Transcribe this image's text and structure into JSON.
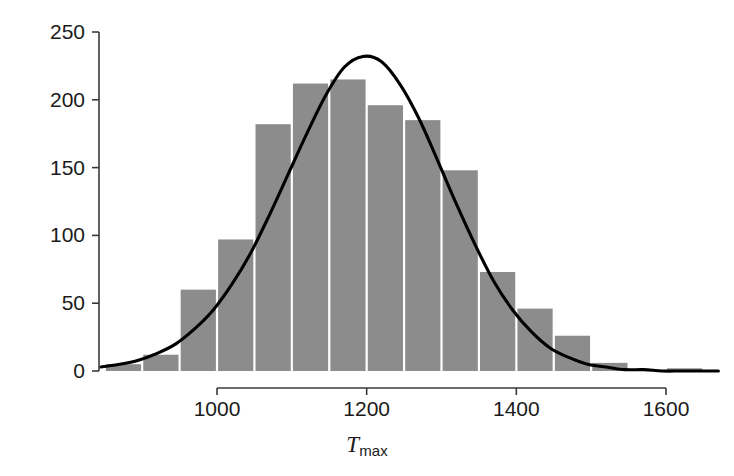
{
  "chart_data": {
    "type": "bar",
    "title": "",
    "subtitle": "",
    "xlabel": "T_max",
    "xlabel_base": "T",
    "xlabel_sub": "max",
    "ylabel": "",
    "xlim": [
      845,
      1672
    ],
    "ylim": [
      0,
      250
    ],
    "grid": false,
    "legend": null,
    "x_ticks": [
      1000,
      1200,
      1400,
      1600
    ],
    "x_tick_labels": [
      "1000",
      "1200",
      "1400",
      "1600"
    ],
    "y_ticks": [
      0,
      50,
      100,
      150,
      200,
      250
    ],
    "y_tick_labels": [
      "0",
      "50",
      "100",
      "150",
      "200",
      "250"
    ],
    "bin_width": 50,
    "bin_edges": [
      850,
      900,
      950,
      1000,
      1050,
      1100,
      1150,
      1200,
      1250,
      1300,
      1350,
      1400,
      1450,
      1500,
      1550,
      1600,
      1650
    ],
    "categories": [
      "850-900",
      "900-950",
      "950-1000",
      "1000-1050",
      "1050-1100",
      "1100-1150",
      "1150-1200",
      "1200-1250",
      "1250-1300",
      "1300-1350",
      "1350-1400",
      "1400-1450",
      "1450-1500",
      "1500-1550",
      "1550-1600",
      "1600-1650"
    ],
    "values": [
      5,
      12,
      60,
      97,
      182,
      212,
      215,
      196,
      185,
      148,
      73,
      46,
      26,
      6,
      0,
      2
    ],
    "bar_color": "#8c8c8c",
    "curve": {
      "name": "fitted normal density",
      "color": "#000000",
      "mean": 1195,
      "sd": 143,
      "peak_value": 232,
      "x": [
        845,
        870,
        895,
        920,
        945,
        970,
        995,
        1020,
        1045,
        1070,
        1095,
        1120,
        1145,
        1170,
        1195,
        1220,
        1245,
        1270,
        1295,
        1320,
        1345,
        1370,
        1395,
        1420,
        1445,
        1470,
        1495,
        1520,
        1545,
        1570,
        1595,
        1620,
        1645,
        1670
      ],
      "y": [
        3,
        5,
        8,
        13,
        20,
        31,
        45,
        64,
        87,
        115,
        145,
        175,
        203,
        224,
        232,
        228,
        211,
        186,
        155,
        123,
        93,
        66,
        45,
        29,
        17,
        10,
        5,
        3,
        1,
        1,
        0,
        0,
        0,
        0
      ]
    }
  },
  "axes": {
    "y_axis_name": "count-axis",
    "x_axis_name": "tmax-axis"
  }
}
